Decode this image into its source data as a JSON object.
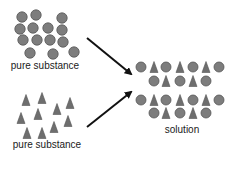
{
  "labels": {
    "top": "pure substance",
    "bottom": "pure substance",
    "right": "solution"
  },
  "colors": {
    "particle_fill": "#7d7d7d",
    "particle_stroke": "#555555",
    "arrow": "#111111",
    "text": "#1a1a1a"
  },
  "top_group": {
    "shape": "circle",
    "particles": [
      [
        22,
        17
      ],
      [
        36,
        15
      ],
      [
        62,
        18
      ],
      [
        20,
        29
      ],
      [
        33,
        28
      ],
      [
        48,
        28
      ],
      [
        62,
        30
      ],
      [
        23,
        40
      ],
      [
        37,
        40
      ],
      [
        50,
        40
      ],
      [
        63,
        42
      ],
      [
        30,
        53
      ],
      [
        53,
        54
      ],
      [
        74,
        52
      ]
    ]
  },
  "bottom_group": {
    "shape": "triangle",
    "particles": [
      [
        26,
        100
      ],
      [
        42,
        98
      ],
      [
        70,
        103
      ],
      [
        21,
        118
      ],
      [
        38,
        114
      ],
      [
        57,
        109
      ],
      [
        68,
        121
      ],
      [
        54,
        127
      ],
      [
        27,
        133
      ],
      [
        42,
        133
      ]
    ]
  },
  "solution": {
    "rows": [
      {
        "y": 67,
        "items": [
          [
            "c",
            141
          ],
          [
            "t",
            154
          ],
          [
            "c",
            166
          ],
          [
            "t",
            180
          ],
          [
            "c",
            193
          ],
          [
            "t",
            206
          ],
          [
            "c",
            219
          ]
        ]
      },
      {
        "y": 81,
        "items": [
          [
            "c",
            154
          ],
          [
            "t",
            166
          ],
          [
            "c",
            180
          ],
          [
            "t",
            193
          ],
          [
            "c",
            206
          ]
        ]
      },
      {
        "y": 100,
        "items": [
          [
            "c",
            141
          ],
          [
            "t",
            154
          ],
          [
            "c",
            166
          ],
          [
            "t",
            180
          ],
          [
            "c",
            193
          ],
          [
            "t",
            206
          ],
          [
            "c",
            219
          ]
        ]
      },
      {
        "y": 113,
        "items": [
          [
            "c",
            154
          ],
          [
            "t",
            166
          ],
          [
            "c",
            180
          ],
          [
            "t",
            193
          ],
          [
            "c",
            206
          ]
        ]
      }
    ]
  },
  "arrows": [
    {
      "from": [
        87,
        38
      ],
      "to": [
        131,
        74
      ]
    },
    {
      "from": [
        87,
        127
      ],
      "to": [
        131,
        92
      ]
    }
  ]
}
